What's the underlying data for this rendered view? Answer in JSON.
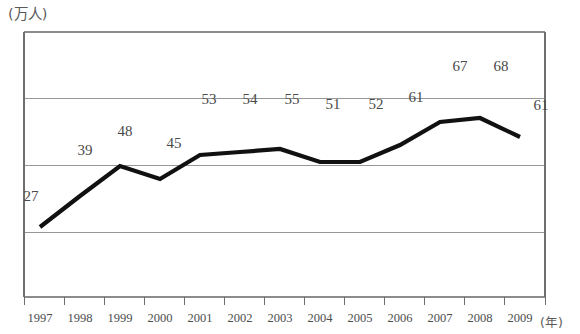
{
  "chart_data": {
    "type": "line",
    "title": "",
    "subtitle": "",
    "xlabel": "(年)",
    "ylabel": "(万人)",
    "grid": true,
    "legend": null,
    "categories": [
      "1997",
      "1998",
      "1999",
      "2000",
      "2001",
      "2002",
      "2003",
      "2004",
      "2005",
      "2006",
      "2007",
      "2008",
      "2009"
    ],
    "values": [
      27,
      39,
      48,
      45,
      53,
      54,
      55,
      51,
      52,
      61,
      67,
      68,
      61
    ],
    "data_labels": [
      "27",
      "39",
      "48",
      "45",
      "53",
      "54",
      "55",
      "51",
      "52",
      "61",
      "67",
      "68",
      "61"
    ],
    "series": [
      {
        "name": "",
        "values": [
          27,
          39,
          48,
          45,
          53,
          54,
          55,
          51,
          52,
          61,
          67,
          68,
          61
        ],
        "color": "#111111"
      }
    ],
    "ylim": [
      0,
      100
    ],
    "yticks": [
      0,
      25,
      50,
      75,
      100
    ],
    "ytick_labels": [
      "",
      "",
      "",
      "",
      ""
    ],
    "xlim_categories": [
      "1997",
      "2009"
    ],
    "gridline_count": 5,
    "line_color": "#111111",
    "gridline_color": "#8c8c8c",
    "axis_color": "#6e6e6e",
    "text_color": "#4a4a4a",
    "background_color": "#ffffff"
  },
  "axes": {
    "y_unit": "(万人)",
    "x_unit": "(年)"
  },
  "geometry": {
    "plot_left": 24,
    "plot_right": 545,
    "plot_top": 32,
    "plot_bottom": 297,
    "point_x": [
      40,
      80,
      120,
      160,
      200,
      240,
      280,
      320,
      360,
      400,
      440,
      480,
      520
    ],
    "point_y": [
      227,
      196,
      166,
      179,
      155,
      152,
      149,
      162,
      162,
      145,
      122,
      118,
      137
    ],
    "gridline_y": [
      32,
      98,
      165,
      232,
      297
    ],
    "tick_x": [
      24,
      64,
      104,
      144,
      184,
      224,
      264,
      304,
      344,
      384,
      424,
      464,
      504,
      545
    ],
    "label_x": [
      31,
      85,
      125,
      174,
      209,
      250,
      292,
      333,
      376,
      416,
      460,
      501,
      541
    ],
    "label_y": [
      188,
      142,
      123,
      135,
      91,
      91,
      91,
      96,
      96,
      89,
      58,
      58,
      97
    ]
  }
}
